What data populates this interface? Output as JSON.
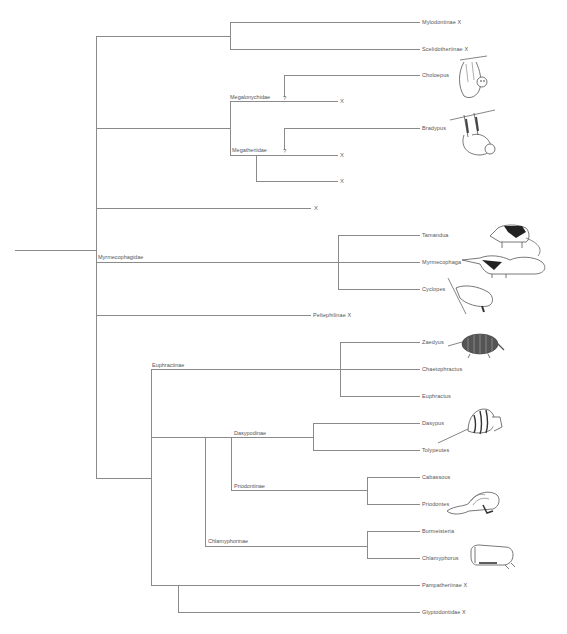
{
  "diagram": {
    "type": "phylogenetic-tree",
    "extinct_marker": "X",
    "uncertain_marker": "?",
    "clade_labels": {
      "megalonychidae": "Megalonychidae",
      "megatheriidae": "Megatheriidae",
      "myrmecophagidae": "Myrmecophagidae",
      "euphractinae": "Euphractinae",
      "dasypodinae": "Dasypodinae",
      "priodontinae": "Priodontinae",
      "chlamyphorinae": "Chlamyphorinae"
    },
    "terminals": [
      {
        "label": "Mylodontinae",
        "extinct": "X"
      },
      {
        "label": "Scelidotheriinae",
        "extinct": "X"
      },
      {
        "label": "Choloepus",
        "extinct": ""
      },
      {
        "label": "",
        "extinct": "X"
      },
      {
        "label": "Bradypus",
        "extinct": ""
      },
      {
        "label": "",
        "extinct": "X"
      },
      {
        "label": "",
        "extinct": "X"
      },
      {
        "label": "",
        "extinct": "X"
      },
      {
        "label": "Tamandua",
        "extinct": ""
      },
      {
        "label": "Myrmecophaga",
        "extinct": ""
      },
      {
        "label": "Cyclopes",
        "extinct": ""
      },
      {
        "label": "Peltephilinae",
        "extinct": "X"
      },
      {
        "label": "Zaedyus",
        "extinct": ""
      },
      {
        "label": "Chaetophractus",
        "extinct": ""
      },
      {
        "label": "Euphractus",
        "extinct": ""
      },
      {
        "label": "Dasypus",
        "extinct": ""
      },
      {
        "label": "Tolypeutes",
        "extinct": ""
      },
      {
        "label": "Cabassous",
        "extinct": ""
      },
      {
        "label": "Priodontes",
        "extinct": ""
      },
      {
        "label": "Burmeisteria",
        "extinct": ""
      },
      {
        "label": "Chlamyphorus",
        "extinct": ""
      },
      {
        "label": "Pampatheriinae",
        "extinct": "X"
      },
      {
        "label": "Glyptodontidae",
        "extinct": "X"
      }
    ],
    "illustrations": [
      "sloth-choloepus",
      "sloth-bradypus",
      "anteater-tamandua",
      "anteater-myrmecophaga",
      "anteater-cyclopes",
      "armadillo-zaedyus",
      "armadillo-tolypeutes",
      "armadillo-priodontes",
      "armadillo-chlamyphorus"
    ]
  }
}
